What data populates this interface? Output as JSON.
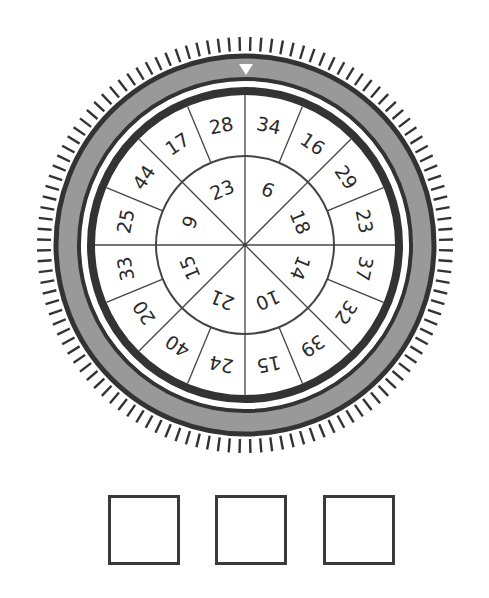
{
  "puzzle": {
    "type": "combination-dial",
    "pointer": "triangle-down",
    "tick_count": 120,
    "colors": {
      "ring_dark": "#333333",
      "ring_grey": "#999999",
      "line": "#444444",
      "text": "#2a2a2a",
      "background": "#ffffff"
    },
    "outer_ring": {
      "label": "Outer ring (clockwise from top)",
      "numbers": [
        "34",
        "16",
        "29",
        "23",
        "37",
        "32",
        "39",
        "15",
        "24",
        "40",
        "20",
        "33",
        "25",
        "44",
        "17",
        "28"
      ]
    },
    "inner_ring": {
      "label": "Inner ring (clockwise from top)",
      "numbers": [
        "6",
        "18",
        "14",
        "10",
        "21",
        "15",
        "9",
        "23"
      ]
    }
  },
  "answer_boxes": [
    {
      "value": ""
    },
    {
      "value": ""
    },
    {
      "value": ""
    }
  ]
}
